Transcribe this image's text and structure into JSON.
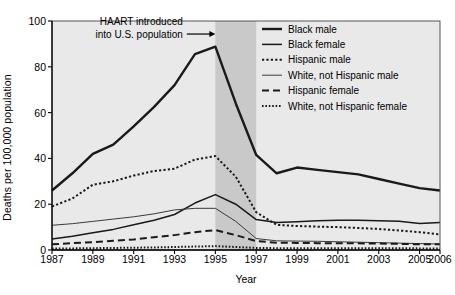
{
  "chart_data": {
    "type": "line",
    "title": "",
    "xlabel": "Year",
    "ylabel": "Deaths per 100,000 population",
    "xlim": [
      1987,
      2006
    ],
    "ylim": [
      0,
      100
    ],
    "grid": false,
    "legend_position": "top-right",
    "x": [
      1987,
      1988,
      1989,
      1990,
      1991,
      1992,
      1993,
      1994,
      1995,
      1996,
      1997,
      1998,
      1999,
      2000,
      2001,
      2002,
      2003,
      2004,
      2005,
      2006
    ],
    "xticks": [
      "1987",
      "1989",
      "1991",
      "1993",
      "1995",
      "1997",
      "1999",
      "2001",
      "2003",
      "2005",
      "2006"
    ],
    "xtick_values": [
      1987,
      1989,
      1991,
      1993,
      1995,
      1997,
      1999,
      2001,
      2003,
      2005,
      2006
    ],
    "yticks": [
      "0",
      "20",
      "40",
      "60",
      "80",
      "100"
    ],
    "ytick_values": [
      0,
      20,
      40,
      60,
      80,
      100
    ],
    "series": [
      {
        "name": "Black male",
        "style": "solid",
        "width": 2.4,
        "color": "#1a1a1a",
        "values": [
          26.0,
          33.5,
          42.0,
          46.0,
          54.0,
          62.5,
          72.0,
          85.5,
          88.8,
          64.0,
          41.5,
          33.5,
          36.0,
          35.0,
          34.0,
          33.0,
          31.0,
          29.0,
          27.0,
          26.0
        ]
      },
      {
        "name": "Black female",
        "style": "solid",
        "width": 1.5,
        "color": "#1a1a1a",
        "values": [
          4.8,
          6.0,
          7.5,
          9.0,
          11.0,
          13.0,
          15.5,
          20.5,
          24.2,
          20.0,
          13.3,
          12.0,
          12.3,
          12.8,
          13.0,
          13.0,
          12.8,
          12.6,
          11.6,
          12.0
        ]
      },
      {
        "name": "Hispanic male",
        "style": "dotted-coarse",
        "width": 2.0,
        "color": "#1a1a1a",
        "values": [
          19.0,
          22.5,
          28.5,
          30.0,
          32.5,
          34.5,
          35.5,
          39.5,
          41.0,
          32.0,
          16.5,
          11.0,
          10.5,
          10.2,
          10.0,
          9.6,
          9.2,
          8.5,
          7.8,
          6.8
        ]
      },
      {
        "name": "White, not Hispanic male",
        "style": "solid",
        "width": 1.0,
        "color": "#3a3a3a",
        "values": [
          10.8,
          11.5,
          12.5,
          13.5,
          14.5,
          15.8,
          17.5,
          18.2,
          18.2,
          12.5,
          5.0,
          4.0,
          3.9,
          3.8,
          3.6,
          3.4,
          3.2,
          3.0,
          2.8,
          2.6
        ]
      },
      {
        "name": "Hispanic female",
        "style": "dashed",
        "width": 2.0,
        "color": "#1a1a1a",
        "values": [
          2.5,
          3.0,
          3.4,
          4.0,
          4.6,
          5.6,
          6.5,
          7.8,
          8.7,
          6.5,
          3.9,
          3.2,
          3.1,
          3.0,
          3.0,
          2.9,
          2.8,
          2.7,
          2.5,
          2.5
        ]
      },
      {
        "name": "White, not Hispanic female",
        "style": "dotted-fine",
        "width": 2.0,
        "color": "#1a1a1a",
        "values": [
          0.6,
          0.7,
          0.8,
          0.9,
          1.0,
          1.1,
          1.3,
          1.5,
          1.7,
          1.3,
          0.9,
          0.8,
          0.8,
          0.8,
          0.8,
          0.8,
          0.8,
          0.8,
          0.7,
          0.7
        ]
      }
    ],
    "annotations": [
      {
        "name": "haart-annotation",
        "line1": "HAART introduced",
        "line2": "into U.S. population",
        "arrow_from_year": 1993.6,
        "arrow_to_year": 1995.0,
        "arrow_value": 93
      }
    ],
    "shaded_bands": [
      {
        "name": "plot-background-band",
        "from": 1987,
        "to": 2006,
        "color": "#e9e9e9"
      },
      {
        "name": "haart-transition-band",
        "from": 1995,
        "to": 1997,
        "color": "#c9c9c9"
      }
    ]
  },
  "legend": {
    "items": [
      {
        "label": "Black male"
      },
      {
        "label": "Black female"
      },
      {
        "label": "Hispanic male"
      },
      {
        "label": "White, not Hispanic male"
      },
      {
        "label": "Hispanic female"
      },
      {
        "label": "White, not Hispanic female"
      }
    ]
  },
  "axes": {
    "y_title": "Deaths per 100,000 population",
    "x_title": "Year"
  }
}
